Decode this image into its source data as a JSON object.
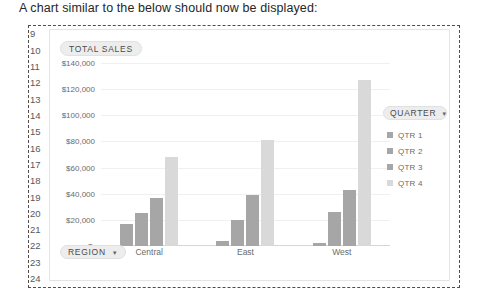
{
  "caption": "A chart similar to the below should now be displayed:",
  "row_headers": [
    "9",
    "10",
    "11",
    "12",
    "13",
    "14",
    "15",
    "16",
    "17",
    "18",
    "19",
    "20",
    "21",
    "22",
    "23",
    "24"
  ],
  "chart_title_badge": {
    "label": "TOTAL SALES"
  },
  "region_badge": {
    "label": "REGION",
    "caret": "▼"
  },
  "legend": {
    "header": {
      "label": "QUARTER",
      "caret": "▼"
    },
    "items": [
      {
        "label": "QTR 1",
        "color": "#a6a6a6"
      },
      {
        "label": "QTR 2",
        "color": "#a6a6a6"
      },
      {
        "label": "QTR 3",
        "color": "#a6a6a6"
      },
      {
        "label": "QTR 4",
        "color": "#d9d9d9"
      }
    ]
  },
  "chart_data": {
    "type": "bar",
    "title": "TOTAL SALES",
    "xlabel": "REGION",
    "ylabel": "",
    "categories": [
      "Central",
      "East",
      "West"
    ],
    "series": [
      {
        "name": "QTR 1",
        "color": "#a6a6a6",
        "values": [
          17000,
          4000,
          2500
        ]
      },
      {
        "name": "QTR 2",
        "color": "#a6a6a6",
        "values": [
          25000,
          20000,
          26000
        ]
      },
      {
        "name": "QTR 3",
        "color": "#a6a6a6",
        "values": [
          37000,
          39000,
          43000
        ]
      },
      {
        "name": "QTR 4",
        "color": "#d9d9d9",
        "values": [
          68000,
          81000,
          127000
        ]
      }
    ],
    "ylim": [
      0,
      140000
    ],
    "ytick_values": [
      0,
      20000,
      40000,
      60000,
      80000,
      100000,
      120000,
      140000
    ],
    "ytick_labels": [
      "$-",
      "$20,000",
      "$40,000",
      "$60,000",
      "$80,000",
      "$100,000",
      "$120,000",
      "$140,000"
    ],
    "grid": true,
    "legend_position": "right"
  }
}
